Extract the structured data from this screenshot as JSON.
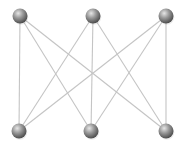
{
  "diagram": {
    "type": "complete-bipartite-graph",
    "name": "K3,3",
    "colors": {
      "background": "#ffffff",
      "edge": "#c4c4c4",
      "node_highlight": "#e6e6e6",
      "node_mid": "#9a9a9a",
      "node_shadow": "#4a4a4a"
    },
    "node_radius": 7.5,
    "nodes": [
      {
        "id": "t1",
        "x": 20,
        "y": 16,
        "group": "top"
      },
      {
        "id": "t2",
        "x": 93,
        "y": 16,
        "group": "top"
      },
      {
        "id": "t3",
        "x": 166,
        "y": 16,
        "group": "top"
      },
      {
        "id": "b1",
        "x": 19,
        "y": 131,
        "group": "bottom"
      },
      {
        "id": "b2",
        "x": 91,
        "y": 131,
        "group": "bottom"
      },
      {
        "id": "b3",
        "x": 166,
        "y": 131,
        "group": "bottom"
      }
    ],
    "edges": [
      [
        "t1",
        "b1"
      ],
      [
        "t1",
        "b2"
      ],
      [
        "t1",
        "b3"
      ],
      [
        "t2",
        "b1"
      ],
      [
        "t2",
        "b2"
      ],
      [
        "t2",
        "b3"
      ],
      [
        "t3",
        "b1"
      ],
      [
        "t3",
        "b2"
      ],
      [
        "t3",
        "b3"
      ]
    ]
  }
}
